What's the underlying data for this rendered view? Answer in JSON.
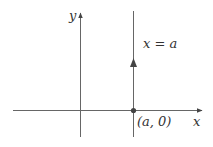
{
  "diagram": {
    "type": "coordinate-plane",
    "axes": {
      "x_label": "x",
      "y_label": "y"
    },
    "vertical_line": {
      "label": "x = a",
      "direction": "upward"
    },
    "point": {
      "label": "(a, 0)"
    },
    "colors": {
      "stroke": "#555555",
      "text": "#333333",
      "background": "#ffffff"
    }
  }
}
